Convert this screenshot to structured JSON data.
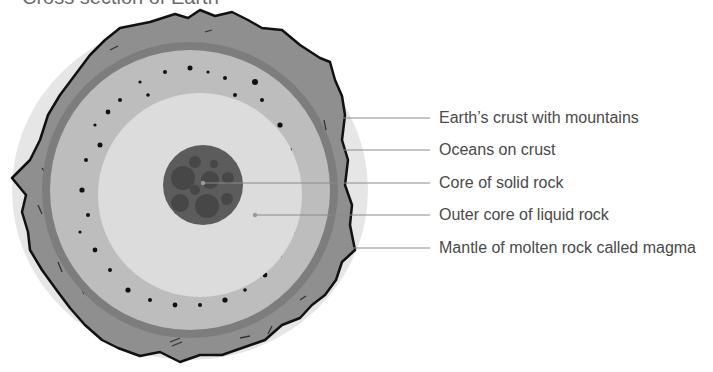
{
  "diagram": {
    "title": "Cross section of Earth",
    "colors": {
      "crust": "#8f8f8f",
      "crust_outline": "#111111",
      "ocean_band": "#7d7d7d",
      "mantle": "#bdbdbd",
      "outer_core": "#dcdcdc",
      "inner_core": "#5c5c5c",
      "inner_core_blobs": "#474747",
      "halo": "#e3e3e3",
      "leader_line": "#8a8a8a",
      "label_text": "#4a4a4a"
    },
    "labels": [
      {
        "text": "Earth’s crust with mountains",
        "y": 143
      },
      {
        "text": "Oceans on crust",
        "y": 175
      },
      {
        "text": "Core of solid rock",
        "y": 207
      },
      {
        "text": "Outer core of liquid rock",
        "y": 239
      },
      {
        "text": "Mantle of molten rock called magma",
        "y": 271
      }
    ]
  }
}
